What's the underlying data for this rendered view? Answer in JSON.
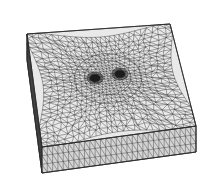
{
  "figure": {
    "title": "",
    "caption": "",
    "kind": "finite-element-mesh",
    "projection": "axonometric",
    "background_color": "#ffffff",
    "line_color": "#2b2b2b",
    "face_fill_top": "#e9e9e9",
    "face_fill_front": "#d4d4d4",
    "face_fill_right": "#c2c2c2",
    "hole_fill": "#1c1c1c"
  },
  "geometry": {
    "shape": "rectangular slab",
    "slab_thickness_px": 26,
    "top_face_corners": {
      "back_left": [
        27,
        34
      ],
      "back_right": [
        170,
        24
      ],
      "front_right": [
        196,
        126
      ],
      "front_left": [
        42,
        147
      ]
    },
    "front_face_corners": {
      "top_left": [
        42,
        147
      ],
      "top_right": [
        196,
        126
      ],
      "bottom_right": [
        196,
        152
      ],
      "bottom_left": [
        42,
        173
      ]
    },
    "left_face_corners": {
      "top_back": [
        27,
        34
      ],
      "top_front": [
        42,
        147
      ],
      "bottom_front": [
        42,
        173
      ],
      "bottom_back": [
        27,
        60
      ]
    }
  },
  "mesh": {
    "type": "unstructured triangular",
    "base_divisions_u": 26,
    "base_divisions_v": 26,
    "refinement": "graded toward centre",
    "refine_center_uv": [
      0.5,
      0.46
    ],
    "refine_radius_uv": 0.28,
    "refine_strength": 2.6,
    "jitter": 0.26,
    "side_rows": 3,
    "line_width": 0.42
  },
  "features": {
    "count": 2,
    "description": "two circular holes in refined central patch",
    "holes": [
      {
        "name": "hole-left",
        "center_uv": [
          0.415,
          0.445
        ],
        "radius_uv": 0.035,
        "ring_radius_uv": 0.055
      },
      {
        "name": "hole-right",
        "center_uv": [
          0.585,
          0.43
        ],
        "radius_uv": 0.035,
        "ring_radius_uv": 0.055
      }
    ],
    "inner_contours": [
      {
        "name": "refined-patch-outline",
        "center_uv": [
          0.5,
          0.46
        ],
        "radius_uv": 0.225
      },
      {
        "name": "refined-patch-inner",
        "center_uv": [
          0.5,
          0.45
        ],
        "radius_uv": 0.155
      }
    ]
  },
  "labels": {
    "figure_label": "",
    "axis_labels": []
  }
}
